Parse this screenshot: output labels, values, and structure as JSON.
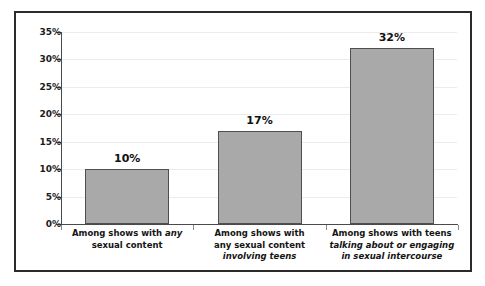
{
  "chart_data": {
    "type": "bar",
    "title": "",
    "subtitle": "",
    "xlabel": "",
    "ylabel": "",
    "ylim": [
      0,
      35
    ],
    "y_tick_step": 5,
    "grid": true,
    "legend": false,
    "legend_position": "none",
    "orientation": "vertical",
    "categories": [
      "Among shows with any sexual content",
      "Among shows with any sexual content involving teens",
      "Among shows with teens talking about or engaging in sexual intercourse"
    ],
    "values": [
      10,
      17,
      32
    ],
    "value_labels": [
      "10%",
      "17%",
      "32%"
    ],
    "y_tick_labels": [
      "0%",
      "5%",
      "10%",
      "15%",
      "20%",
      "25%",
      "30%",
      "35%"
    ],
    "y_tick_values": [
      0,
      5,
      10,
      15,
      20,
      25,
      30,
      35
    ],
    "bar_color": "#a9a9a9",
    "bar_edge_color": "#4f4f4f",
    "gridline_color": "#ececec",
    "axis_color": "#4a4a4a",
    "frame_color": "#2b2b2b",
    "background_color": "#ffffff",
    "category_labels": [
      {
        "lines": [
          [
            {
              "text": "Among shows with ",
              "italic": false
            },
            {
              "text": "any",
              "italic": true
            }
          ],
          [
            {
              "text": "sexual content",
              "italic": false
            }
          ]
        ]
      },
      {
        "lines": [
          [
            {
              "text": "Among shows with",
              "italic": false
            }
          ],
          [
            {
              "text": "any sexual content",
              "italic": false
            }
          ],
          [
            {
              "text": "involving teens",
              "italic": true
            }
          ]
        ]
      },
      {
        "lines": [
          [
            {
              "text": "Among shows with teens",
              "italic": false
            }
          ],
          [
            {
              "text": "talking about or engaging",
              "italic": true
            }
          ],
          [
            {
              "text": "in sexual intercourse",
              "italic": true
            }
          ]
        ]
      }
    ]
  }
}
